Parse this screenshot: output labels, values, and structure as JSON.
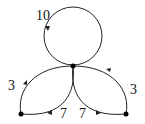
{
  "diagram": {
    "nodes": [
      {
        "id": "center",
        "x": 73,
        "y": 66
      },
      {
        "id": "left",
        "x": 21,
        "y": 114
      },
      {
        "id": "right",
        "x": 126,
        "y": 114
      }
    ],
    "edges": [
      {
        "id": "loop",
        "from": "center",
        "to": "center",
        "label": "10"
      },
      {
        "id": "left-outer",
        "from": "left",
        "to": "center",
        "label": "3"
      },
      {
        "id": "left-inner",
        "from": "center",
        "to": "left",
        "label": "7"
      },
      {
        "id": "right-inner",
        "from": "center",
        "to": "right",
        "label": "7"
      },
      {
        "id": "right-outer",
        "from": "right",
        "to": "center",
        "label": "3"
      }
    ],
    "labels": {
      "loop": "10",
      "left_outer": "3",
      "left_inner": "7",
      "right_inner": "7",
      "right_outer": "3"
    }
  }
}
